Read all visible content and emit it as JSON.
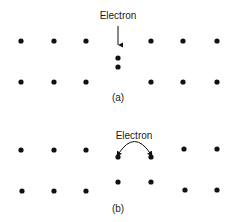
{
  "colors": {
    "ink": "#111111",
    "background": "#ffffff"
  },
  "panels": [
    {
      "id": "a",
      "caption": "(a)",
      "caption_pos": [
        118,
        101
      ],
      "label": "Electron",
      "label_pos": [
        118,
        19
      ],
      "arrow": {
        "x": 118,
        "y1": 26,
        "y2": 45
      },
      "lattice_atoms": [
        [
          21,
          41
        ],
        [
          54,
          41
        ],
        [
          86,
          41
        ],
        [
          151,
          41
        ],
        [
          183,
          41
        ],
        [
          217,
          41
        ],
        [
          21,
          82
        ],
        [
          54,
          82
        ],
        [
          86,
          82
        ],
        [
          151,
          82
        ],
        [
          183,
          82
        ],
        [
          217,
          82
        ]
      ],
      "interstitial_atoms": [
        [
          118,
          58
        ],
        [
          118,
          67
        ]
      ]
    },
    {
      "id": "b",
      "caption": "(b)",
      "caption_pos": [
        118,
        212
      ],
      "label": "Electron",
      "label_pos": [
        134,
        139
      ],
      "hop_arc": {
        "from": [
          118,
          156
        ],
        "to": [
          151,
          156
        ],
        "peak_y": 143
      },
      "lattice_atoms": [
        [
          21,
          150
        ],
        [
          54,
          150
        ],
        [
          86,
          150
        ],
        [
          184,
          149
        ],
        [
          217,
          149
        ],
        [
          22,
          191
        ],
        [
          54,
          191
        ],
        [
          86,
          191
        ],
        [
          185,
          190
        ],
        [
          217,
          190
        ]
      ],
      "displaced_atoms": [
        [
          118,
          157
        ],
        [
          151,
          157
        ],
        [
          118,
          182
        ],
        [
          151,
          182
        ]
      ]
    }
  ]
}
